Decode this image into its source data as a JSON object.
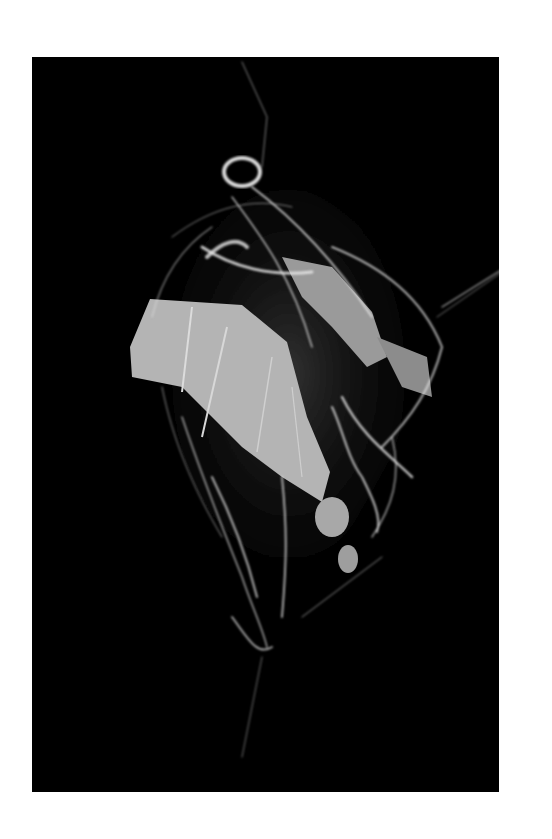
{
  "image": {
    "subject": "spider web with wing fragments",
    "background_color": "#ffffff",
    "frame_color": "#000000",
    "palette": {
      "wing_light": "#b9b9b9",
      "wing_mid": "#9a9a9a",
      "web_strand": "#e8e8e8",
      "web_haze": "#6a6a6a"
    }
  }
}
